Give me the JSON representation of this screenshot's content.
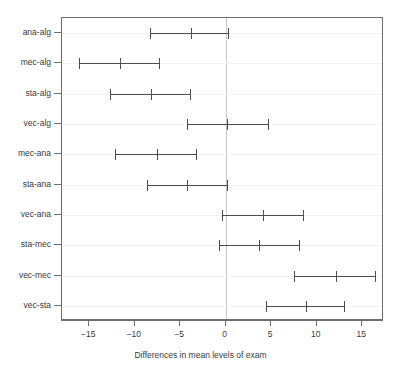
{
  "chart_data": {
    "type": "errorbar",
    "title": "",
    "xlabel": "Differences in mean levels of exam",
    "ylabel": "",
    "xlim": [
      -18.0,
      17.4
    ],
    "ylim": [
      0.5,
      10.5
    ],
    "grid": false,
    "reference_line": {
      "value": 0,
      "color": "#c8c8c8",
      "orientation": "vertical"
    },
    "xticks": [
      -15,
      -10,
      -5,
      0,
      5,
      10,
      15
    ],
    "xticklabels": [
      "-15",
      "-10",
      "-5",
      "0",
      "5",
      "10",
      "15"
    ],
    "categories": [
      "ana-alg",
      "mec-alg",
      "sta-alg",
      "vec-alg",
      "mec-ana",
      "sta-ana",
      "vec-ana",
      "sta-mec",
      "vec-mec",
      "vec-sta"
    ],
    "series": [
      {
        "name": "95% family-wise confidence interval",
        "points": [
          {
            "category": "ana-alg",
            "lower": -8.3,
            "estimate": -3.8,
            "upper": 0.3
          },
          {
            "category": "mec-alg",
            "lower": -16.1,
            "estimate": -11.6,
            "upper": -7.3
          },
          {
            "category": "sta-alg",
            "lower": -12.7,
            "estimate": -8.2,
            "upper": -3.9
          },
          {
            "category": "vec-alg",
            "lower": -4.3,
            "estimate": 0.1,
            "upper": 4.6
          },
          {
            "category": "mec-ana",
            "lower": -12.2,
            "estimate": -7.6,
            "upper": -3.3
          },
          {
            "category": "sta-ana",
            "lower": -8.7,
            "estimate": -4.3,
            "upper": 0.1
          },
          {
            "category": "vec-ana",
            "lower": -0.4,
            "estimate": 4.1,
            "upper": 8.5
          },
          {
            "category": "sta-mec",
            "lower": -0.7,
            "estimate": 3.7,
            "upper": 8.1
          },
          {
            "category": "vec-mec",
            "lower": 7.5,
            "estimate": 12.1,
            "upper": 16.4
          },
          {
            "category": "vec-sta",
            "lower": 4.4,
            "estimate": 8.8,
            "upper": 13.0
          }
        ]
      }
    ],
    "colors": {
      "interval": "#4d4d4d",
      "axis": "#6e6e6e",
      "reference": "#c8c8c8"
    }
  }
}
